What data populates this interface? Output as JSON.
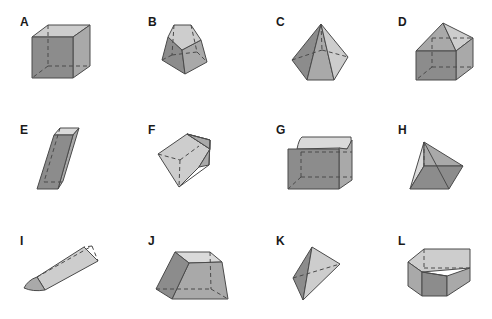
{
  "figure": {
    "shapes": [
      {
        "label": "A",
        "name": "cube"
      },
      {
        "label": "B",
        "name": "pentagonal-frustum"
      },
      {
        "label": "C",
        "name": "hexagonal-pyramid"
      },
      {
        "label": "D",
        "name": "cube-with-roof"
      },
      {
        "label": "E",
        "name": "oblique-rectangular-prism"
      },
      {
        "label": "F",
        "name": "pentagonal-solid"
      },
      {
        "label": "G",
        "name": "box-with-curved-top"
      },
      {
        "label": "H",
        "name": "square-pyramid"
      },
      {
        "label": "I",
        "name": "triangular-prism-with-curved-end"
      },
      {
        "label": "J",
        "name": "rectangular-frustum"
      },
      {
        "label": "K",
        "name": "tetrahedron"
      },
      {
        "label": "L",
        "name": "pentagonal-prism"
      }
    ],
    "colors": {
      "dark": "#8c8c8c",
      "mid": "#a9a9a9",
      "light": "#cdcdcd",
      "edge": "#4a4a4a"
    }
  }
}
